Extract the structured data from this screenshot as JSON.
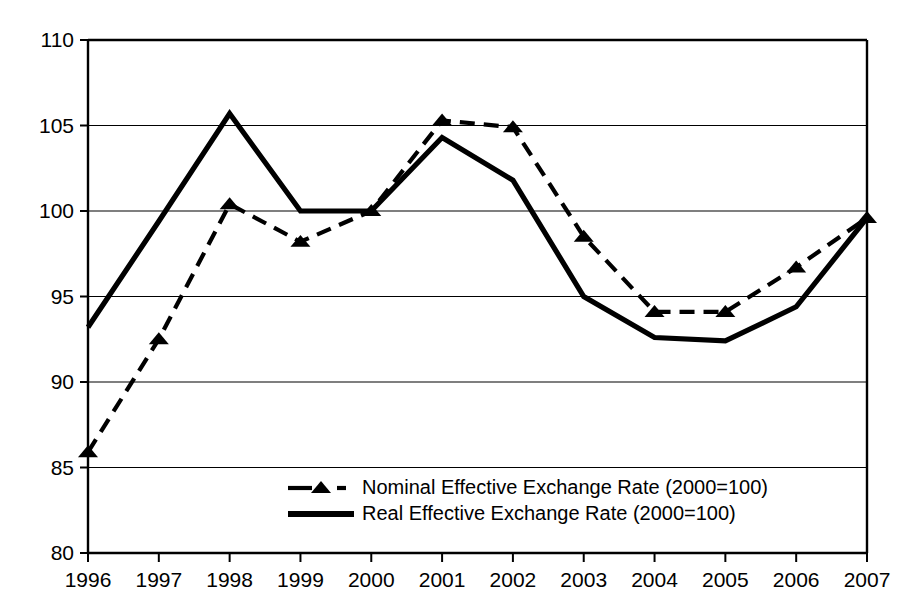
{
  "chart_data": {
    "type": "line",
    "title": "",
    "subtitle": "",
    "xlabel": "",
    "ylabel": "",
    "x": [
      1996,
      1997,
      1998,
      1999,
      2000,
      2001,
      2002,
      2003,
      2004,
      2005,
      2006,
      2007
    ],
    "categories": [
      "1996",
      "1997",
      "1998",
      "1999",
      "2000",
      "2001",
      "2002",
      "2003",
      "2004",
      "2005",
      "2006",
      "2007"
    ],
    "xlim": [
      1996,
      2007
    ],
    "ylim": [
      80,
      110
    ],
    "yticks": [
      80,
      85,
      90,
      95,
      100,
      105,
      110
    ],
    "ytick_labels": [
      "80",
      "85",
      "90",
      "95",
      "100",
      "105",
      "110"
    ],
    "grid": true,
    "grid_axis": "y",
    "legend_position": "inside-bottom-center",
    "series": [
      {
        "name": "Nominal Effective Exchange Rate (2000=100)",
        "style": "dashed",
        "marker": "triangle",
        "color": "#000000",
        "values": [
          85.9,
          92.5,
          100.4,
          98.2,
          100.0,
          105.3,
          104.9,
          98.5,
          94.1,
          94.1,
          96.7,
          99.6
        ]
      },
      {
        "name": "Real Effective Exchange Rate (2000=100)",
        "style": "solid",
        "marker": "none",
        "color": "#000000",
        "values": [
          93.2,
          99.4,
          105.7,
          100.0,
          100.0,
          104.3,
          101.8,
          95.0,
          92.6,
          92.4,
          94.4,
          99.6
        ]
      }
    ]
  },
  "legend": {
    "items": [
      {
        "label": "Nominal Effective Exchange Rate (2000=100)",
        "style": "dashed-triangle"
      },
      {
        "label": "Real Effective Exchange Rate (2000=100)",
        "style": "solid"
      }
    ]
  }
}
